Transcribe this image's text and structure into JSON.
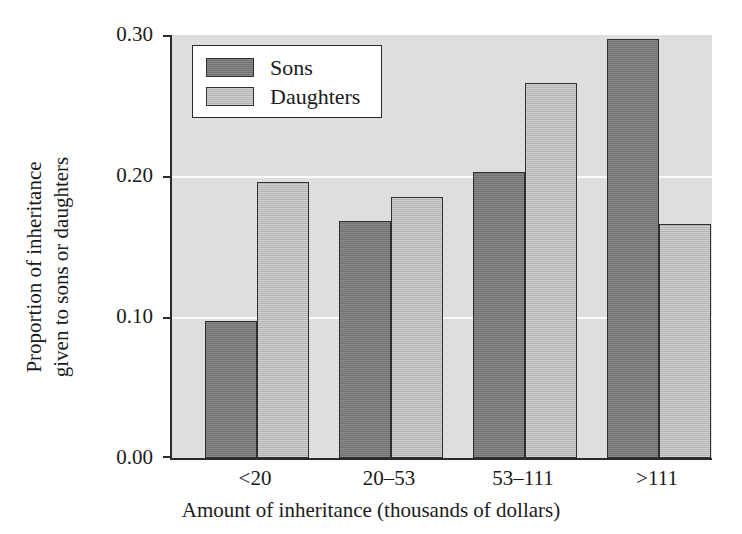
{
  "chart_data": {
    "type": "bar",
    "title": "",
    "subtitle": "",
    "xlabel": "Amount of inheritance (thousands of dollars)",
    "ylabel_lines": [
      "Proportion of inheritance",
      "given to sons or daughters"
    ],
    "ylabel": "Proportion of inheritance given to sons or daughters",
    "categories": [
      "<20",
      "20–53",
      "53–111",
      ">111"
    ],
    "series": [
      {
        "name": "Sons",
        "values": [
          0.097,
          0.168,
          0.203,
          0.297
        ],
        "color": "#7a7a7a"
      },
      {
        "name": "Daughters",
        "values": [
          0.196,
          0.185,
          0.266,
          0.166
        ],
        "color": "#bdbdbd"
      }
    ],
    "ylim": [
      0.0,
      0.3
    ],
    "yticks": [
      0.0,
      0.1,
      0.2,
      0.3
    ],
    "ytick_labels": [
      "0.00",
      "0.10",
      "0.20",
      "0.30"
    ],
    "xlim_note": "categorical",
    "grid": "horizontal gridlines at 0.10 and 0.20, white on grey panel",
    "legend_position": "top-left inside plot area",
    "panel_background": "#dedede",
    "gridline_color": "#fbfbfb",
    "axis_color": "#2b2b2b"
  },
  "legend": {
    "entries": [
      {
        "label": "Sons",
        "swatch": "sons"
      },
      {
        "label": "Daughters",
        "swatch": "daughters"
      }
    ]
  }
}
